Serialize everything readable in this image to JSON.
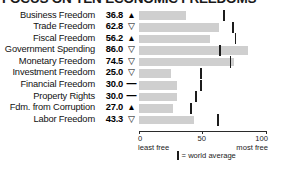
{
  "chart_data": {
    "type": "bar",
    "title": "FOCUS ON TEN ECONOMIC FREEDOMS",
    "xlabel": "",
    "ylabel": "",
    "xlim": [
      0,
      100
    ],
    "grid": false,
    "legend_position": "bottom",
    "axis": {
      "ticks": [
        {
          "value": 0,
          "label": "0",
          "sublabel": "least free"
        },
        {
          "value": 50,
          "label": "50",
          "sublabel": ""
        },
        {
          "value": 100,
          "label": "100",
          "sublabel": "most free"
        }
      ]
    },
    "legend": {
      "marker": "world-average-tick",
      "text": "= world average"
    },
    "categories": [
      "Business Freedom",
      "Trade Freedom",
      "Fiscal Freedom",
      "Government Spending",
      "Monetary Freedom",
      "Investment Freedom",
      "Financial Freedom",
      "Property Rights",
      "Fdm. from Corruption",
      "Labor Freedom"
    ],
    "values": [
      36.8,
      62.8,
      56.2,
      86.0,
      74.5,
      25.0,
      30.0,
      30.0,
      27.0,
      43.3
    ],
    "value_labels": [
      "36.8",
      "62.8",
      "56.2",
      "86.0",
      "74.5",
      "25.0",
      "30.0",
      "30.0",
      "27.0",
      "43.3"
    ],
    "trends": [
      "up",
      "down",
      "up",
      "down",
      "down",
      "down",
      "flat",
      "flat",
      "up",
      "down"
    ],
    "trend_glyphs": [
      "▲",
      "▽",
      "▲",
      "▽",
      "▽",
      "▽",
      "—",
      "—",
      "▲",
      "▽"
    ],
    "world_average": [
      67.0,
      74.0,
      76.0,
      64.0,
      72.0,
      49.0,
      49.0,
      45.0,
      41.0,
      62.0
    ],
    "colors": {
      "bar": "#cfcfcf",
      "average_tick": "#1c1c1c",
      "text": "#111111",
      "background": "#ffffff"
    }
  }
}
